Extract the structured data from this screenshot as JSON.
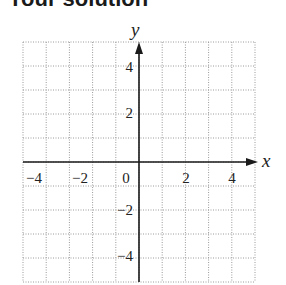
{
  "header": {
    "title": "Your solution"
  },
  "graph": {
    "x_axis_label": "x",
    "y_axis_label": "y",
    "x_range": [
      -5,
      5
    ],
    "y_range": [
      -5,
      5
    ],
    "grid_step": 1,
    "x_tick_labels": [
      "−4",
      "−2",
      "0",
      "2",
      "4"
    ],
    "y_tick_labels": [
      "4",
      "2",
      "−2",
      "−4"
    ],
    "grid_style": "dotted",
    "colors": {
      "grid": "#9a9a9a",
      "axes": "#1a1a1a",
      "background": "#ffffff"
    }
  }
}
